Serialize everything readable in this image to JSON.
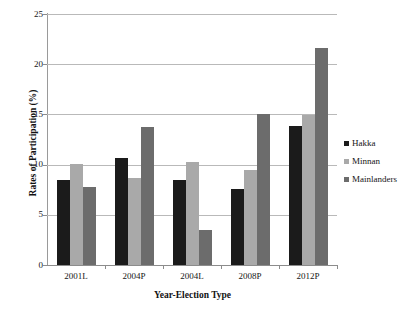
{
  "chart_data": {
    "type": "bar",
    "title": "",
    "xlabel": "Year-Election Type",
    "ylabel": "Rates of Participation (%)",
    "categories": [
      "2001L",
      "2004P",
      "2004L",
      "2008P",
      "2012P"
    ],
    "series": [
      {
        "name": "Hakka",
        "color": "#1b1b1b",
        "values": [
          8.5,
          10.7,
          8.5,
          7.6,
          13.8
        ]
      },
      {
        "name": "Minnan",
        "color": "#a9a9a9",
        "values": [
          10.1,
          8.7,
          10.3,
          9.5,
          14.9
        ]
      },
      {
        "name": "Mainlanders",
        "color": "#6c6c6c",
        "values": [
          7.8,
          13.7,
          3.5,
          15.0,
          21.6
        ]
      }
    ],
    "ylim": [
      0,
      25
    ],
    "yticks": [
      0,
      5,
      10,
      15,
      20,
      25
    ],
    "ytick_labels": [
      "0",
      "5",
      "10",
      "15",
      "20",
      "25"
    ],
    "grid": "horizontal",
    "legend_position": "right"
  }
}
